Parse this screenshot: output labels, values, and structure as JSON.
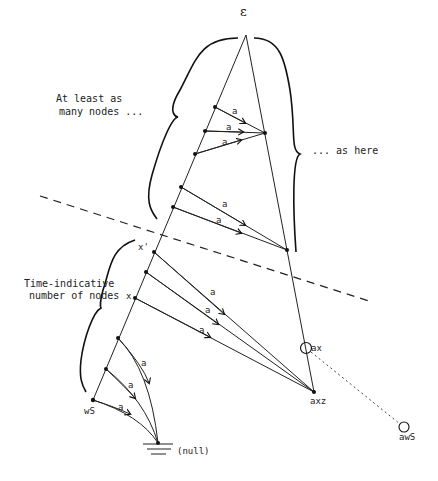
{
  "diagram": {
    "root_label": "ε",
    "upper_left_label": [
      "At least as",
      "many nodes ..."
    ],
    "upper_right_label": "... as here",
    "lower_left_label": [
      "Time-indicative",
      "number of nodes"
    ],
    "edge_label": "a",
    "node_labels": {
      "x_prime": "x'",
      "x": "x",
      "ws": "wS",
      "ax": "ax",
      "axz": "axz",
      "aws": "awS",
      "null": "(null)"
    },
    "edge_labels": [
      "a",
      "a",
      "a",
      "a",
      "a",
      "a",
      "a",
      "a",
      "a",
      "a",
      "a"
    ]
  }
}
